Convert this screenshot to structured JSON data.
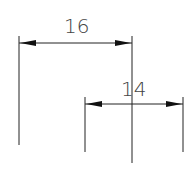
{
  "diagram": {
    "type": "dimension-drawing",
    "colors": {
      "line": "#222222",
      "text": "#444444",
      "background": "#ffffff"
    },
    "dimensions": [
      {
        "label": "16",
        "from_x": 19,
        "to_x": 132,
        "line_y": 43
      },
      {
        "label": "14",
        "from_x": 85,
        "to_x": 183,
        "line_y": 104
      }
    ],
    "extension_lines": [
      {
        "x": 19,
        "y1": 36,
        "y2": 145
      },
      {
        "x": 85,
        "y1": 97,
        "y2": 152
      },
      {
        "x": 132,
        "y1": 36,
        "y2": 163
      },
      {
        "x": 183,
        "y1": 97,
        "y2": 152
      }
    ]
  }
}
